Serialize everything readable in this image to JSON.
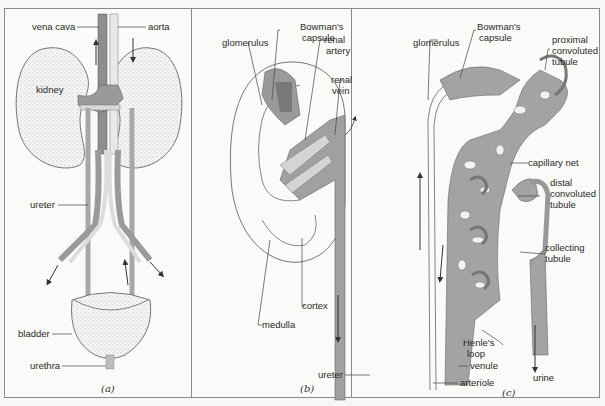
{
  "figure": {
    "panels": [
      {
        "id": "a",
        "caption": "(a)",
        "labels": {
          "vena_cava": "vena cava",
          "aorta": "aorta",
          "kidney": "kidney",
          "ureter": "ureter",
          "bladder": "bladder",
          "urethra": "urethra"
        }
      },
      {
        "id": "b",
        "caption": "(b)",
        "labels": {
          "glomerulus": "glomerulus",
          "bowmans_capsule_1": "Bowman's",
          "bowmans_capsule_2": "capsule",
          "renal_artery_1": "renal",
          "renal_artery_2": "artery",
          "renal_vein_1": "renal",
          "renal_vein_2": "vein",
          "cortex": "cortex",
          "medulla": "medulla",
          "ureter": "ureter"
        }
      },
      {
        "id": "c",
        "caption": "(c)",
        "labels": {
          "glomerulus": "glomerulus",
          "bowmans_capsule_1": "Bowman's",
          "bowmans_capsule_2": "capsule",
          "proximal_1": "proximal",
          "proximal_2": "convoluted",
          "proximal_3": "tubule",
          "capillary_net": "capillary net",
          "distal_1": "distal",
          "distal_2": "convoluted",
          "distal_3": "tubule",
          "collecting_1": "collecting",
          "collecting_2": "tubule",
          "henles_loop_1": "Henle's",
          "henles_loop_2": "loop",
          "venule": "venule",
          "arteriole": "arteriole",
          "urine": "urine"
        }
      }
    ],
    "colors": {
      "vessel_gray": "#9a9a9a",
      "light_gray": "#c9c9c9",
      "line": "#555555",
      "background": "#fafaf8"
    }
  }
}
